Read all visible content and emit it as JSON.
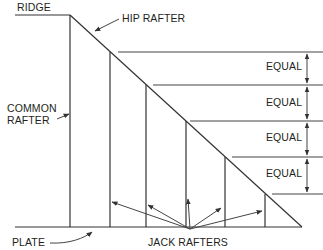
{
  "diagram": {
    "labels": {
      "ridge": "RIDGE",
      "hip_rafter": "HIP RAFTER",
      "common_rafter_line1": "COMMON",
      "common_rafter_line2": "RAFTER",
      "plate": "PLATE",
      "jack_rafters": "JACK RAFTERS",
      "equal": [
        "EQUAL",
        "EQUAL",
        "EQUAL",
        "EQUAL"
      ]
    },
    "colors": {
      "line": "#333333",
      "text": "#231f20",
      "background": "#ffffff"
    },
    "jack_rafter_count": 5,
    "equal_spacing_count": 4
  }
}
